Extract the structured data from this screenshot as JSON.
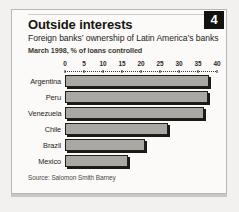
{
  "card": {
    "title": "Outside interests",
    "badge_number": "4",
    "subtitle": "Foreign banks’ ownership of Latin America’s banks",
    "subsubtitle": "March 1998, % of loans controlled",
    "source": "Source: Salomon Smith Barney"
  },
  "colors": {
    "bar_fill": "#a9a8a3",
    "bar_outline": "#211f1a",
    "bar_shadow": "#1b1a16",
    "badge_background": "#121210",
    "card_background": "#fbfaf8",
    "page_background": "#f2f1ef",
    "spine": "#b6b4b0"
  },
  "chart_data": {
    "type": "bar",
    "orientation": "horizontal",
    "title": "Outside interests",
    "subtitle": "Foreign banks’ ownership of Latin America’s banks",
    "xlabel": "March 1998, % of loans controlled",
    "ylabel": "",
    "categories": [
      "Argentina",
      "Peru",
      "Venezuela",
      "Chile",
      "Brazil",
      "Mexico"
    ],
    "values": [
      38,
      37.5,
      36.5,
      27,
      21,
      16.5
    ],
    "xlim": [
      0,
      40
    ],
    "xticks": [
      0,
      5,
      10,
      15,
      20,
      25,
      30,
      35,
      40
    ],
    "xtick_labels": [
      "0",
      "5",
      "10",
      "15",
      "20",
      "25",
      "30",
      "35",
      "40"
    ],
    "grid": false,
    "legend": false,
    "source": "Source: Salomon Smith Barney"
  }
}
